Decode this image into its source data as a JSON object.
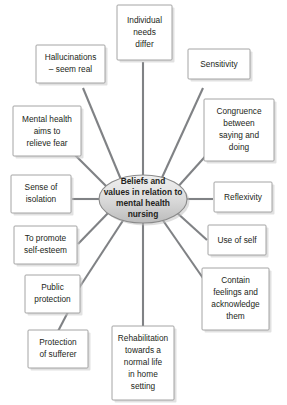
{
  "diagram": {
    "type": "spoke-and-hub mind map",
    "hub": {
      "lines": [
        "Beliefs and",
        "values in relation to",
        "mental health",
        "nursing"
      ]
    },
    "nodes": [
      {
        "id": "individual-needs-differ",
        "lines": [
          "Individual",
          "needs",
          "differ"
        ]
      },
      {
        "id": "hallucinations-seem-real",
        "lines": [
          "Hallucinations",
          "– seem real"
        ]
      },
      {
        "id": "sensitivity",
        "lines": [
          "Sensitivity"
        ]
      },
      {
        "id": "mental-health-aims-to-relieve-fear",
        "lines": [
          "Mental health",
          "aims to",
          "relieve fear"
        ]
      },
      {
        "id": "congruence-between-saying-and-doing",
        "lines": [
          "Congruence",
          "between",
          "saying and",
          "doing"
        ]
      },
      {
        "id": "sense-of-isolation",
        "lines": [
          "Sense of",
          "isolation"
        ]
      },
      {
        "id": "reflexivity",
        "lines": [
          "Reflexivity"
        ]
      },
      {
        "id": "to-promote-self-esteem",
        "lines": [
          "To promote",
          "self-esteem"
        ]
      },
      {
        "id": "use-of-self",
        "lines": [
          "Use of self"
        ]
      },
      {
        "id": "public-protection",
        "lines": [
          "Public",
          "protection"
        ]
      },
      {
        "id": "contain-feelings-and-acknowledge-them",
        "lines": [
          "Contain",
          "feelings and",
          "acknowledge",
          "them"
        ]
      },
      {
        "id": "protection-of-sufferer",
        "lines": [
          "Protection",
          "of sufferer"
        ]
      },
      {
        "id": "rehabilitation-towards-a-normal-life-in-home-setting",
        "lines": [
          "Rehabilitation",
          "towards a",
          "normal life",
          "in home",
          "setting"
        ]
      }
    ],
    "colors": {
      "line": "#808285",
      "box_border": "#9a9a9a",
      "box_fill": "#ffffff",
      "hub_fill_light": "#f0f0f0",
      "hub_fill_dark": "#c4c4c4",
      "text": "#231f20",
      "background": "#ffffff"
    }
  }
}
